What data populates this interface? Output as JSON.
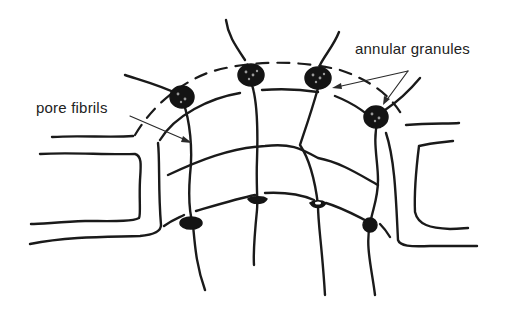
{
  "diagram": {
    "labels": {
      "pore_fibrils": "pore fibrils",
      "annular_granules": "annular granules"
    },
    "colors": {
      "ink": "#1a1a1a",
      "background": "#ffffff",
      "label_text": "#222222"
    }
  }
}
